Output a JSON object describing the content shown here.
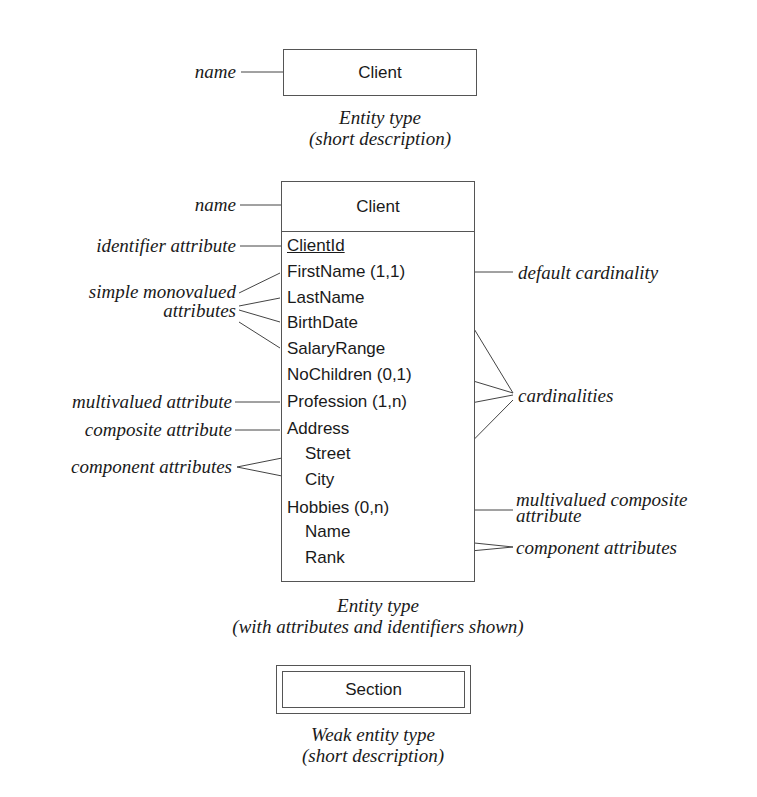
{
  "figure1": {
    "entity_name": "Client",
    "label_name": "name",
    "caption_line1": "Entity type",
    "caption_line2": "(short description)"
  },
  "figure2": {
    "entity_name": "Client",
    "attributes": [
      {
        "text": "ClientId",
        "identifier": true
      },
      {
        "text": "FirstName (1,1)"
      },
      {
        "text": "LastName"
      },
      {
        "text": "BirthDate"
      },
      {
        "text": "SalaryRange"
      },
      {
        "text": "NoChildren (0,1)"
      },
      {
        "text": "Profession (1,n)"
      },
      {
        "text": "Address"
      },
      {
        "text": "Street",
        "component": true
      },
      {
        "text": "City",
        "component": true
      },
      {
        "text": "Hobbies (0,n)"
      },
      {
        "text": "Name",
        "component": true
      },
      {
        "text": "Rank",
        "component": true
      }
    ],
    "left_labels": {
      "name": "name",
      "identifier": "identifier attribute",
      "simple_line1": "simple monovalued",
      "simple_line2": "attributes",
      "multivalued": "multivalued attribute",
      "composite": "composite attribute",
      "component": "component attributes"
    },
    "right_labels": {
      "default_cardinality": "default cardinality",
      "cardinalities": "cardinalities",
      "multi_composite_line1": "multivalued composite",
      "multi_composite_line2": "attribute",
      "component": "component attributes"
    },
    "caption_line1": "Entity type",
    "caption_line2": "(with attributes and identifiers shown)"
  },
  "figure3": {
    "entity_name": "Section",
    "caption_line1": "Weak entity type",
    "caption_line2": "(short description)"
  },
  "colors": {
    "line": "#444444",
    "text": "#1a1a1a",
    "background": "#ffffff"
  }
}
